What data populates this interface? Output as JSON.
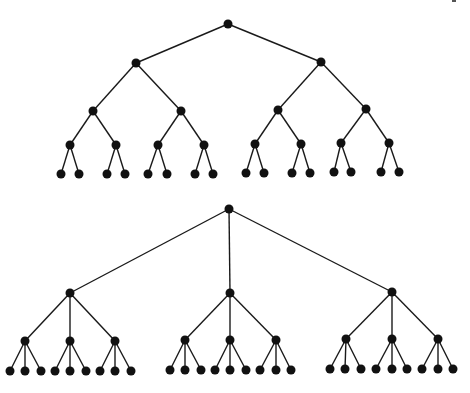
{
  "diagram": {
    "type": "tree-diagrams",
    "colors": {
      "edge": "#1a1a1a",
      "node": "#111111",
      "background": "#ffffff"
    },
    "node_radius": 4.5,
    "trees": [
      {
        "name": "binary-tree",
        "branching_factor": 2,
        "depth": 5,
        "levels": [
          [
            [
              228,
              24
            ]
          ],
          [
            [
              136,
              63
            ],
            [
              321,
              62
            ]
          ],
          [
            [
              93,
              111
            ],
            [
              181,
              111
            ],
            [
              278,
              110
            ],
            [
              366,
              109
            ]
          ],
          [
            [
              70,
              145
            ],
            [
              116,
              145
            ],
            [
              158,
              145
            ],
            [
              204,
              145
            ],
            [
              255,
              144
            ],
            [
              301,
              144
            ],
            [
              341,
              143
            ],
            [
              389,
              143
            ]
          ],
          [
            [
              61,
              174
            ],
            [
              79,
              174
            ],
            [
              107,
              174
            ],
            [
              125,
              174
            ],
            [
              148,
              174
            ],
            [
              167,
              174
            ],
            [
              195,
              174
            ],
            [
              213,
              174
            ],
            [
              246,
              173
            ],
            [
              264,
              173
            ],
            [
              292,
              173
            ],
            [
              310,
              173
            ],
            [
              334,
              172
            ],
            [
              351,
              172
            ],
            [
              381,
              172
            ],
            [
              399,
              172
            ]
          ]
        ]
      },
      {
        "name": "ternary-tree",
        "branching_factor": 3,
        "depth": 4,
        "levels": [
          [
            [
              229,
              209
            ]
          ],
          [
            [
              70,
              293
            ],
            [
              230,
              293
            ],
            [
              392,
              292
            ]
          ],
          [
            [
              25,
              341
            ],
            [
              70,
              341
            ],
            [
              115,
              341
            ],
            [
              185,
              340
            ],
            [
              230,
              340
            ],
            [
              276,
              340
            ],
            [
              346,
              339
            ],
            [
              392,
              339
            ],
            [
              438,
              339
            ]
          ],
          [
            [
              10,
              371
            ],
            [
              25,
              371
            ],
            [
              41,
              371
            ],
            [
              55,
              371
            ],
            [
              70,
              371
            ],
            [
              86,
              371
            ],
            [
              100,
              371
            ],
            [
              115,
              371
            ],
            [
              131,
              371
            ],
            [
              170,
              370
            ],
            [
              185,
              370
            ],
            [
              201,
              370
            ],
            [
              215,
              370
            ],
            [
              230,
              370
            ],
            [
              246,
              370
            ],
            [
              260,
              370
            ],
            [
              276,
              370
            ],
            [
              291,
              370
            ],
            [
              330,
              369
            ],
            [
              345,
              369
            ],
            [
              361,
              369
            ],
            [
              376,
              369
            ],
            [
              392,
              369
            ],
            [
              407,
              369
            ],
            [
              422,
              369
            ],
            [
              438,
              369
            ],
            [
              453,
              369
            ]
          ]
        ]
      }
    ]
  }
}
